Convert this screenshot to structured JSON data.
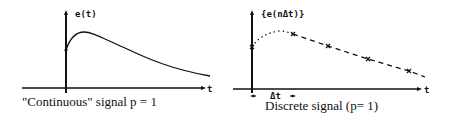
{
  "left_panel": {
    "y_axis_label": "e(t)",
    "x_axis_label": "t",
    "caption": "\"Continuous\" signal  p  =  1"
  },
  "right_panel": {
    "y_axis_label": "{e(nΔt)}",
    "x_axis_label": "t",
    "interval_label": "Δt",
    "caption": "Discrete  signal  (p= 1)"
  },
  "colors": {
    "ink": "#111111",
    "background": "#ffffff"
  }
}
